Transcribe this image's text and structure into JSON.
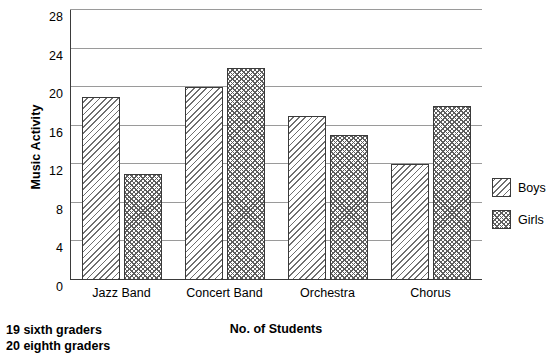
{
  "chart_data": {
    "type": "bar",
    "title": "",
    "xlabel": "No. of Students",
    "ylabel": "Music Activity",
    "categories": [
      "Jazz Band",
      "Concert Band",
      "Orchestra",
      "Chorus"
    ],
    "series": [
      {
        "name": "Boys",
        "values": [
          19,
          20,
          17,
          12
        ]
      },
      {
        "name": "Girls",
        "values": [
          11,
          22,
          15,
          18
        ]
      }
    ],
    "ylim": [
      0,
      28
    ],
    "yticks": [
      0,
      4,
      8,
      12,
      16,
      20,
      24,
      28
    ],
    "ytick_labels": [
      "0",
      "4",
      "8",
      "12",
      "16",
      "20",
      "24",
      "28"
    ],
    "grid": true,
    "legend_position": "right"
  },
  "axis": {
    "y_title": "Music Activity",
    "x_title": "No. of Students"
  },
  "legend": {
    "items": [
      {
        "label": "Boys",
        "pattern": "diagonal-hatch"
      },
      {
        "label": "Girls",
        "pattern": "cross-hatch"
      }
    ]
  },
  "footnote": {
    "line1": "19 sixth graders",
    "line2": "20 eighth graders"
  }
}
